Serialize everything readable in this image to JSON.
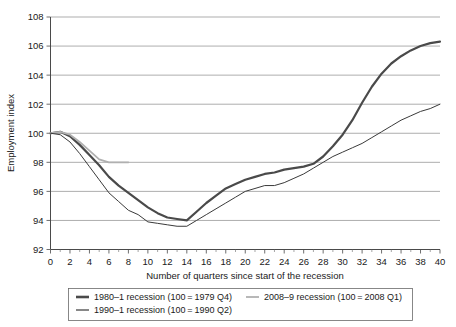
{
  "chart_data": {
    "type": "line",
    "title": "",
    "xlabel": "Number of quarters since start of the recession",
    "ylabel": "Employment index",
    "xlim": [
      0,
      40
    ],
    "ylim": [
      92,
      108
    ],
    "xticks": [
      0,
      2,
      4,
      6,
      8,
      10,
      12,
      14,
      16,
      18,
      20,
      22,
      24,
      26,
      28,
      30,
      32,
      34,
      36,
      38,
      40
    ],
    "yticks": [
      92,
      94,
      96,
      98,
      100,
      102,
      104,
      106,
      108
    ],
    "grid": "horizontal",
    "legend_position": "bottom",
    "series": [
      {
        "name": "1980–1 recession (100 = 1979 Q4)",
        "color": "#4a4a4a",
        "width": 2.2,
        "x": [
          0,
          1,
          2,
          3,
          4,
          5,
          6,
          7,
          8,
          9,
          10,
          11,
          12,
          13,
          14,
          15,
          16,
          17,
          18,
          19,
          20,
          21,
          22,
          23,
          24,
          25,
          26,
          27,
          28,
          29,
          30,
          31,
          32,
          33,
          34,
          35,
          36,
          37,
          38,
          39,
          40
        ],
        "values": [
          100.0,
          100.1,
          99.8,
          99.2,
          98.5,
          97.8,
          97.0,
          96.4,
          95.9,
          95.4,
          94.9,
          94.5,
          94.2,
          94.1,
          94.0,
          94.6,
          95.2,
          95.7,
          96.2,
          96.5,
          96.8,
          97.0,
          97.2,
          97.3,
          97.5,
          97.6,
          97.7,
          97.9,
          98.4,
          99.1,
          99.9,
          100.9,
          102.1,
          103.2,
          104.1,
          104.8,
          105.3,
          105.7,
          106.0,
          106.2,
          106.3
        ]
      },
      {
        "name": "2008–9 recession (100 = 2008 Q1)",
        "color": "#b0b0b0",
        "width": 1.8,
        "x": [
          0,
          1,
          2,
          3,
          4,
          5,
          6,
          7,
          8
        ],
        "values": [
          100.0,
          100.1,
          99.9,
          99.4,
          98.8,
          98.2,
          98.0,
          98.0,
          98.0
        ]
      },
      {
        "name": "1990–1 recession (100 = 1990 Q2)",
        "color": "#3a3a3a",
        "width": 1.0,
        "x": [
          0,
          1,
          2,
          3,
          4,
          5,
          6,
          7,
          8,
          9,
          10,
          11,
          12,
          13,
          14,
          15,
          16,
          17,
          18,
          19,
          20,
          21,
          22,
          23,
          24,
          25,
          26,
          27,
          28,
          29,
          30,
          31,
          32,
          33,
          34,
          35,
          36,
          37,
          38,
          39,
          40
        ],
        "values": [
          100.0,
          99.9,
          99.4,
          98.6,
          97.7,
          96.8,
          95.9,
          95.3,
          94.7,
          94.4,
          93.9,
          93.8,
          93.7,
          93.6,
          93.6,
          94.0,
          94.4,
          94.8,
          95.2,
          95.6,
          96.0,
          96.2,
          96.4,
          96.4,
          96.6,
          96.9,
          97.2,
          97.6,
          98.0,
          98.4,
          98.7,
          99.0,
          99.3,
          99.7,
          100.1,
          100.5,
          100.9,
          101.2,
          101.5,
          101.7,
          102.0
        ]
      }
    ]
  },
  "axis": {
    "y_title": "Employment index",
    "x_title": "Number of quarters since start of the recession",
    "y_tick_labels": [
      "108",
      "106",
      "104",
      "102",
      "100",
      "98",
      "96",
      "94",
      "92"
    ],
    "x_tick_labels": [
      "0",
      "2",
      "4",
      "6",
      "8",
      "10",
      "12",
      "14",
      "16",
      "18",
      "20",
      "22",
      "24",
      "26",
      "28",
      "30",
      "32",
      "34",
      "36",
      "38",
      "40"
    ]
  },
  "legend": {
    "entries": [
      {
        "label": "1980–1 recession (100 = 1979 Q4)",
        "color": "#4a4a4a",
        "width": 2.6
      },
      {
        "label": "2008–9 recession (100 = 2008 Q1)",
        "color": "#b0b0b0",
        "width": 1.8
      },
      {
        "label": "1990–1 recession (100 = 1990 Q2)",
        "color": "#3a3a3a",
        "width": 1.2
      }
    ]
  }
}
